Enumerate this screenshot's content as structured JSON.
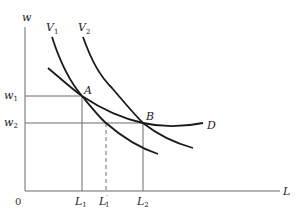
{
  "diagram": {
    "type": "labor-demand-indifference-diagram",
    "axes": {
      "y_label": "w",
      "x_label": "L",
      "origin_label": "0"
    },
    "y_ticks": [
      {
        "base": "w",
        "sub": "1"
      },
      {
        "base": "w",
        "sub": "2"
      }
    ],
    "x_ticks": [
      {
        "base": "L",
        "sub": "1",
        "prime": ""
      },
      {
        "base": "L",
        "sub": "1",
        "prime": "′"
      },
      {
        "base": "L",
        "sub": "2",
        "prime": ""
      }
    ],
    "curves": [
      {
        "base": "V",
        "sub": "1",
        "desc": "indifference curve V1"
      },
      {
        "base": "V",
        "sub": "2",
        "desc": "indifference curve V2"
      },
      {
        "base": "D",
        "sub": "",
        "desc": "labor demand curve"
      }
    ],
    "points": [
      {
        "label": "A",
        "at": "w1, L1"
      },
      {
        "label": "B",
        "at": "w2, L2"
      }
    ],
    "colors": {
      "curve": "#1a1a1a",
      "axis": "#6a6a6a",
      "background": "#ffffff"
    }
  }
}
